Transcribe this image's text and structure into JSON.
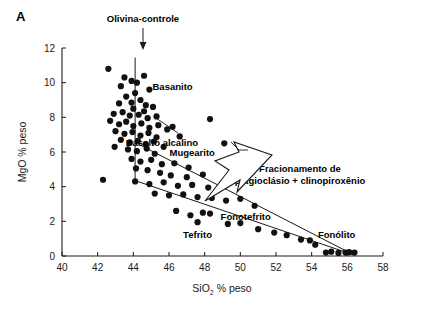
{
  "panel": {
    "label": "A"
  },
  "axes": {
    "x": {
      "title_main": "SiO",
      "title_sub": "2",
      "title_tail": " % peso",
      "min": 40,
      "max": 58,
      "step": 2,
      "ticks": [
        40,
        42,
        44,
        46,
        48,
        50,
        52,
        54,
        56,
        58
      ]
    },
    "y": {
      "title": "MgO % peso",
      "min": 0,
      "max": 12,
      "step": 2,
      "ticks": [
        0,
        2,
        4,
        6,
        8,
        10,
        12
      ]
    }
  },
  "annotations": {
    "olivine_control": "Olivina-controle",
    "fractionation_line1": "Fracionamento de",
    "fractionation_line2": "plagioclásio + clinopiroxênio"
  },
  "field_labels": [
    {
      "text": "Basanito",
      "x": 46.2,
      "y": 9.55
    },
    {
      "text": "Basalto alcalino",
      "x": 45.6,
      "y": 6.35
    },
    {
      "text": "Mugearito",
      "x": 47.3,
      "y": 5.75
    },
    {
      "text": "Fonotefrito",
      "x": 50.3,
      "y": 2.05
    },
    {
      "text": "Tefrito",
      "x": 47.6,
      "y": 1.05
    },
    {
      "text": "Fonólito",
      "x": 55.4,
      "y": 1.05
    }
  ],
  "chart_data": {
    "type": "scatter",
    "title": "A",
    "xlabel": "SiO2 % peso",
    "ylabel": "MgO % peso",
    "xlim": [
      40,
      58
    ],
    "ylim": [
      0,
      12
    ],
    "grid": false,
    "legend": null,
    "marker": {
      "shape": "circle",
      "color": "#111111",
      "size_px": 3.1
    },
    "points": [
      [
        42.6,
        10.8
      ],
      [
        43.5,
        10.3
      ],
      [
        43.9,
        10.1
      ],
      [
        44.6,
        10.4
      ],
      [
        43.3,
        9.8
      ],
      [
        44.2,
        10.0
      ],
      [
        44.1,
        9.4
      ],
      [
        44.9,
        9.6
      ],
      [
        43.6,
        9.2
      ],
      [
        44.4,
        9.0
      ],
      [
        43.9,
        8.85
      ],
      [
        44.7,
        8.7
      ],
      [
        43.2,
        8.8
      ],
      [
        44.0,
        8.5
      ],
      [
        44.6,
        8.35
      ],
      [
        45.1,
        8.6
      ],
      [
        42.9,
        8.2
      ],
      [
        43.4,
        8.3
      ],
      [
        43.8,
        8.1
      ],
      [
        44.3,
        8.15
      ],
      [
        44.8,
        7.95
      ],
      [
        45.3,
        8.05
      ],
      [
        42.7,
        7.8
      ],
      [
        43.2,
        7.6
      ],
      [
        43.6,
        7.75
      ],
      [
        44.0,
        7.5
      ],
      [
        44.45,
        7.65
      ],
      [
        44.9,
        7.4
      ],
      [
        45.4,
        7.55
      ],
      [
        45.9,
        7.3
      ],
      [
        43.0,
        7.2
      ],
      [
        43.5,
        7.05
      ],
      [
        43.95,
        7.15
      ],
      [
        44.4,
        6.95
      ],
      [
        44.85,
        7.1
      ],
      [
        45.3,
        6.85
      ],
      [
        46.2,
        7.45
      ],
      [
        43.3,
        6.7
      ],
      [
        43.8,
        6.55
      ],
      [
        44.25,
        6.65
      ],
      [
        44.7,
        6.45
      ],
      [
        45.15,
        6.6
      ],
      [
        45.7,
        6.3
      ],
      [
        46.6,
        6.9
      ],
      [
        42.95,
        6.3
      ],
      [
        43.7,
        6.15
      ],
      [
        44.2,
        6.05
      ],
      [
        44.75,
        6.2
      ],
      [
        45.2,
        5.9
      ],
      [
        48.3,
        7.9
      ],
      [
        49.1,
        6.5
      ],
      [
        43.9,
        5.6
      ],
      [
        44.4,
        5.45
      ],
      [
        45.0,
        5.55
      ],
      [
        45.6,
        5.3
      ],
      [
        46.3,
        5.35
      ],
      [
        47.1,
        5.1
      ],
      [
        44.15,
        5.05
      ],
      [
        44.8,
        4.95
      ],
      [
        45.5,
        4.8
      ],
      [
        46.1,
        4.65
      ],
      [
        47.0,
        4.55
      ],
      [
        47.9,
        4.7
      ],
      [
        42.3,
        4.4
      ],
      [
        44.1,
        4.3
      ],
      [
        44.9,
        4.15
      ],
      [
        45.7,
        4.25
      ],
      [
        46.5,
        4.05
      ],
      [
        47.3,
        4.1
      ],
      [
        48.2,
        3.95
      ],
      [
        49.0,
        4.2
      ],
      [
        45.2,
        3.6
      ],
      [
        46.0,
        3.5
      ],
      [
        46.8,
        3.55
      ],
      [
        47.6,
        3.4
      ],
      [
        48.4,
        3.35
      ],
      [
        49.2,
        3.2
      ],
      [
        50.0,
        3.3
      ],
      [
        50.8,
        2.9
      ],
      [
        46.4,
        2.6
      ],
      [
        47.2,
        2.35
      ],
      [
        47.9,
        2.5
      ],
      [
        48.3,
        2.45
      ],
      [
        47.6,
        1.95
      ],
      [
        49.3,
        1.85
      ],
      [
        50.0,
        1.9
      ],
      [
        51.0,
        1.55
      ],
      [
        51.9,
        1.35
      ],
      [
        52.6,
        1.2
      ],
      [
        53.4,
        0.95
      ],
      [
        54.2,
        0.65
      ],
      [
        54.8,
        0.2
      ],
      [
        55.1,
        0.25
      ],
      [
        55.5,
        0.18
      ],
      [
        55.9,
        0.2
      ],
      [
        56.1,
        0.22
      ],
      [
        56.4,
        0.2
      ],
      [
        53.9,
        0.9
      ]
    ],
    "trend_lines": [
      {
        "name": "upper-fractionation-trend",
        "x1": 44.1,
        "y1": 6.55,
        "x2": 56.3,
        "y2": 0.1
      },
      {
        "name": "lower-fractionation-trend",
        "x1": 44.1,
        "y1": 4.35,
        "x2": 56.4,
        "y2": 0.05
      }
    ],
    "reference_lines": [
      {
        "name": "olivine-control-line",
        "x": 44.1,
        "y_top": 11.45,
        "y_bottom": 4.35
      }
    ]
  }
}
